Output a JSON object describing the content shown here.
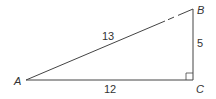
{
  "diagram": {
    "type": "right-triangle",
    "vertices": {
      "A": {
        "label": "A"
      },
      "B": {
        "label": "B"
      },
      "C": {
        "label": "C"
      }
    },
    "sides": {
      "AB": {
        "label": "13"
      },
      "AC": {
        "label": "12"
      },
      "BC": {
        "label": "5"
      }
    },
    "right_angle_at": "C",
    "colors": {
      "stroke": "#444444",
      "text": "#333333"
    }
  }
}
